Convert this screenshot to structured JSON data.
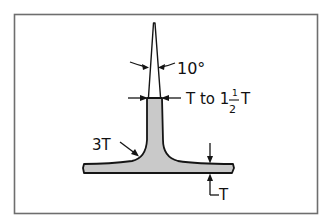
{
  "figure": {
    "type": "technical-drawing",
    "colors": {
      "background": "#ffffff",
      "frame": "#6e6e6e",
      "outline": "#151515",
      "fill": "#c9c9c9"
    }
  },
  "labels": {
    "draft_angle": "10°",
    "rib_width_prefix": "T to 1",
    "rib_width_frac_num": "1",
    "rib_width_frac_den": "2",
    "rib_width_suffix": "T",
    "fillet_radius": "3T",
    "wall_thickness": "T"
  }
}
